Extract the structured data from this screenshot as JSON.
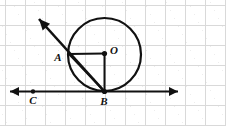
{
  "figure": {
    "canvas": {
      "width": 226,
      "height": 126
    },
    "background": {
      "color": "#ffffff",
      "grid": {
        "visible": true,
        "color": "#d9d9d9",
        "spacing": 20,
        "offset_x": 5,
        "offset_y": 5
      }
    },
    "stroke_color": "#111111",
    "points": [
      {
        "id": "A",
        "label": "A",
        "x": 69,
        "y": 54,
        "label_x": 58,
        "label_y": 58,
        "dot": false
      },
      {
        "id": "O",
        "label": "O",
        "x": 104.5,
        "y": 53.5,
        "label_x": 114,
        "label_y": 51,
        "dot": true
      },
      {
        "id": "B",
        "label": "B",
        "x": 104.5,
        "y": 91.5,
        "label_x": 104,
        "label_y": 102,
        "dot": true
      },
      {
        "id": "C",
        "label": "C",
        "x": 33,
        "y": 91.5,
        "label_x": 33,
        "label_y": 101,
        "dot": true
      }
    ],
    "circle": {
      "center_x": 104.5,
      "center_y": 54.5,
      "radius": 36.5,
      "label": "circle O"
    },
    "segments": [
      {
        "id": "AO",
        "label": "radius A to O",
        "x1": 69,
        "y1": 54,
        "x2": 104.5,
        "y2": 53.5
      },
      {
        "id": "OB",
        "label": "radius O to B",
        "x1": 104.5,
        "y1": 53.5,
        "x2": 104.5,
        "y2": 91.5
      },
      {
        "id": "AB",
        "label": "chord A to B",
        "x1": 69,
        "y1": 54,
        "x2": 104.5,
        "y2": 91.5
      }
    ],
    "rays": [
      {
        "id": "ray-BA",
        "label": "ray from B through A",
        "x1": 104.5,
        "y1": 91.5,
        "x2": 39,
        "y2": 19,
        "arrow_at": "end"
      }
    ],
    "lines": [
      {
        "id": "tangent-line",
        "label": "tangent line through C and B",
        "x1": 10,
        "y1": 91.5,
        "x2": 178,
        "y2": 91.5,
        "arrow_at": "both"
      }
    ]
  }
}
